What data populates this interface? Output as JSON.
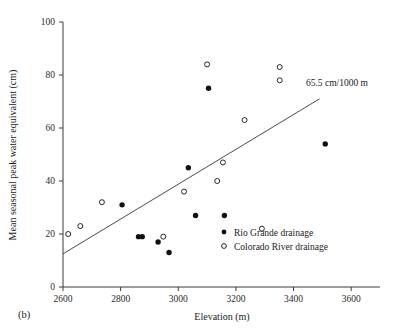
{
  "chart_data": {
    "type": "scatter",
    "title": "",
    "panel_label": "(b)",
    "xlabel": "Elevation (m)",
    "ylabel": "Mean seasonal peak water equivalent (cm)",
    "xlim": [
      2600,
      3700
    ],
    "ylim": [
      0,
      100
    ],
    "xticks": [
      2600,
      2800,
      3000,
      3200,
      3400,
      3600
    ],
    "yticks": [
      0,
      20,
      40,
      60,
      80,
      100
    ],
    "grid": false,
    "legend_position": "bottom-right-inside",
    "annotations": [
      {
        "text": "65.5 cm/1000 m",
        "x": 3430,
        "y": 86
      }
    ],
    "trendline": {
      "label": "65.5 cm/1000 m",
      "slope_cm_per_1000m": 65.5,
      "x_start": 2600,
      "y_start": 12.5,
      "x_end": 3490,
      "y_end": 71.0
    },
    "series": [
      {
        "name": "Rio Grande drainage",
        "marker": "filled-circle",
        "color": "#111111",
        "points": [
          {
            "x": 2805,
            "y": 31
          },
          {
            "x": 2862,
            "y": 19
          },
          {
            "x": 2875,
            "y": 19
          },
          {
            "x": 2930,
            "y": 17
          },
          {
            "x": 2968,
            "y": 13
          },
          {
            "x": 3035,
            "y": 45
          },
          {
            "x": 3060,
            "y": 27
          },
          {
            "x": 3105,
            "y": 75
          },
          {
            "x": 3160,
            "y": 27
          },
          {
            "x": 3510,
            "y": 54
          }
        ]
      },
      {
        "name": "Colorado River drainage",
        "marker": "open-circle",
        "color": "#111111",
        "points": [
          {
            "x": 2618,
            "y": 20
          },
          {
            "x": 2660,
            "y": 23
          },
          {
            "x": 2735,
            "y": 32
          },
          {
            "x": 2948,
            "y": 19
          },
          {
            "x": 3020,
            "y": 36
          },
          {
            "x": 3100,
            "y": 84
          },
          {
            "x": 3135,
            "y": 40
          },
          {
            "x": 3155,
            "y": 47
          },
          {
            "x": 3230,
            "y": 63
          },
          {
            "x": 3290,
            "y": 22
          },
          {
            "x": 3352,
            "y": 83
          },
          {
            "x": 3352,
            "y": 78
          }
        ]
      }
    ]
  },
  "legend": {
    "items": [
      {
        "label": "Rio Grande drainage",
        "marker": "filled-circle"
      },
      {
        "label": "Colorado River drainage",
        "marker": "open-circle"
      }
    ]
  },
  "axes": {
    "x_title": "Elevation (m)",
    "y_title": "Mean seasonal peak water equivalent (cm)",
    "x_tick_labels": [
      "2600",
      "2800",
      "3000",
      "3200",
      "3400",
      "3600"
    ],
    "y_tick_labels": [
      "0",
      "20",
      "40",
      "60",
      "80",
      "100"
    ]
  },
  "panel": {
    "label": "(b)"
  },
  "annotation": {
    "trend_text": "65.5 cm/1000 m"
  }
}
